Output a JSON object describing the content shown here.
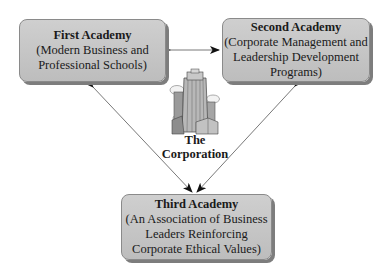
{
  "diagram": {
    "nodes": [
      {
        "id": "first",
        "title": "First Academy",
        "lines": [
          "(Modern Business and",
          "Professional Schools)"
        ]
      },
      {
        "id": "second",
        "title": "Second Academy",
        "lines": [
          "(Corporate Management and",
          "Leadership Development",
          "Programs)"
        ]
      },
      {
        "id": "third",
        "title": "Third Academy",
        "lines": [
          "(An Association of Business",
          "Leaders Reinforcing",
          "Corporate Ethical Values)"
        ]
      }
    ],
    "center": {
      "icon": "building-icon",
      "label_line1": "The",
      "label_line2": "Corporation"
    },
    "edges": [
      {
        "from": "first",
        "to": "second",
        "type": "bidirectional"
      },
      {
        "from": "first",
        "to": "third",
        "type": "bidirectional"
      },
      {
        "from": "second",
        "to": "third",
        "type": "bidirectional"
      }
    ],
    "colors": {
      "box_fill": "#c4c4c4",
      "box_border": "#8a8a8a",
      "shadow": "#7d7d7d",
      "line": "#555555",
      "arrowhead": "#111111"
    }
  }
}
